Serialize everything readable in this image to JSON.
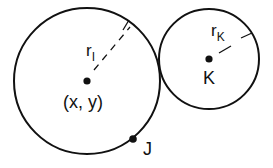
{
  "diagram": {
    "colors": {
      "stroke": "#111111",
      "background": "#ffffff"
    },
    "circles": [
      {
        "id": "I",
        "center": {
          "x": 87,
          "y": 81
        },
        "radius": 73,
        "center_label": "(x, y)",
        "radius_label_main": "r",
        "radius_label_sub": "I"
      },
      {
        "id": "K",
        "center": {
          "x": 209,
          "y": 59
        },
        "radius": 50,
        "center_label": "K",
        "radius_label_main": "r",
        "radius_label_sub": "K"
      }
    ],
    "points": [
      {
        "id": "J",
        "label": "J",
        "x": 133,
        "y": 139
      }
    ]
  }
}
